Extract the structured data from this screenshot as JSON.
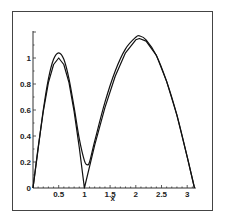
{
  "chart_data": {
    "type": "line",
    "title": "",
    "xlabel": "x",
    "ylabel": "",
    "xlim": [
      0,
      3.1416
    ],
    "ylim": [
      0,
      1.2
    ],
    "grid": false,
    "legend": null,
    "x_ticks": [
      "0",
      "0.5",
      "1",
      "1.5",
      "2",
      "2.5",
      "3"
    ],
    "y_ticks": [
      "0.2",
      "0.4",
      "0.6",
      "0.8",
      "1"
    ],
    "origin_label": "0",
    "series": [
      {
        "name": "exact (piecewise, sharp cusp at x=1)",
        "x": [
          0,
          0.1,
          0.2,
          0.3,
          0.4,
          0.5,
          0.6,
          0.7,
          0.8,
          0.9,
          1.0,
          1.2,
          1.4,
          1.6,
          1.8,
          2.0,
          2.07,
          2.2,
          2.4,
          2.6,
          2.8,
          3.0,
          3.1416
        ],
        "y": [
          0,
          0.31,
          0.59,
          0.81,
          0.95,
          1.0,
          0.95,
          0.81,
          0.59,
          0.31,
          0,
          0.33,
          0.62,
          0.86,
          1.04,
          1.14,
          1.15,
          1.13,
          1.02,
          0.82,
          0.56,
          0.24,
          0
        ]
      },
      {
        "name": "approximation (smooth)",
        "x": [
          0,
          0.1,
          0.2,
          0.3,
          0.4,
          0.5,
          0.6,
          0.7,
          0.8,
          0.9,
          1.0,
          1.05,
          1.1,
          1.2,
          1.4,
          1.6,
          1.8,
          2.0,
          2.07,
          2.2,
          2.4,
          2.6,
          2.8,
          3.0,
          3.1416
        ],
        "y": [
          0,
          0.3,
          0.6,
          0.84,
          0.99,
          1.04,
          0.99,
          0.84,
          0.62,
          0.38,
          0.21,
          0.18,
          0.2,
          0.36,
          0.66,
          0.9,
          1.07,
          1.16,
          1.17,
          1.14,
          1.02,
          0.82,
          0.56,
          0.24,
          0
        ]
      }
    ]
  }
}
